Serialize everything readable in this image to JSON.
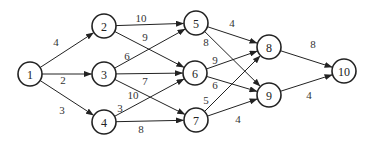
{
  "diagram": {
    "type": "directed-weighted-network",
    "nodes": [
      {
        "id": "1",
        "label": "1",
        "x": 30,
        "y": 74
      },
      {
        "id": "2",
        "label": "2",
        "x": 104,
        "y": 26
      },
      {
        "id": "3",
        "label": "3",
        "x": 104,
        "y": 74
      },
      {
        "id": "4",
        "label": "4",
        "x": 104,
        "y": 122
      },
      {
        "id": "5",
        "label": "5",
        "x": 196,
        "y": 23
      },
      {
        "id": "6",
        "label": "6",
        "x": 195,
        "y": 73
      },
      {
        "id": "7",
        "label": "7",
        "x": 196,
        "y": 120
      },
      {
        "id": "8",
        "label": "8",
        "x": 269,
        "y": 47
      },
      {
        "id": "9",
        "label": "9",
        "x": 269,
        "y": 95
      },
      {
        "id": "10",
        "label": "10",
        "x": 344,
        "y": 71
      }
    ],
    "edges": [
      {
        "from": "1",
        "to": "2",
        "weight": "4",
        "lx": 56,
        "ly": 42
      },
      {
        "from": "1",
        "to": "3",
        "weight": "2",
        "lx": 63,
        "ly": 80
      },
      {
        "from": "1",
        "to": "4",
        "weight": "3",
        "lx": 62,
        "ly": 110
      },
      {
        "from": "2",
        "to": "5",
        "weight": "10",
        "lx": 141,
        "ly": 18
      },
      {
        "from": "2",
        "to": "6",
        "weight": "9",
        "lx": 145,
        "ly": 37
      },
      {
        "from": "3",
        "to": "5",
        "weight": "6",
        "lx": 127,
        "ly": 56
      },
      {
        "from": "3",
        "to": "6",
        "weight": "7",
        "lx": 145,
        "ly": 81
      },
      {
        "from": "3",
        "to": "7",
        "weight": "10",
        "lx": 133,
        "ly": 95
      },
      {
        "from": "4",
        "to": "6",
        "weight": "3",
        "lx": 120,
        "ly": 108
      },
      {
        "from": "4",
        "to": "7",
        "weight": "8",
        "lx": 141,
        "ly": 129
      },
      {
        "from": "5",
        "to": "8",
        "weight": "4",
        "lx": 232,
        "ly": 23
      },
      {
        "from": "5",
        "to": "9",
        "weight": "8",
        "lx": 206,
        "ly": 42
      },
      {
        "from": "6",
        "to": "8",
        "weight": "9",
        "lx": 215,
        "ly": 60
      },
      {
        "from": "6",
        "to": "9",
        "weight": "6",
        "lx": 215,
        "ly": 85
      },
      {
        "from": "7",
        "to": "8",
        "weight": "5",
        "lx": 206,
        "ly": 100
      },
      {
        "from": "7",
        "to": "9",
        "weight": "4",
        "lx": 238,
        "ly": 119
      },
      {
        "from": "8",
        "to": "10",
        "weight": "8",
        "lx": 313,
        "ly": 44
      },
      {
        "from": "9",
        "to": "10",
        "weight": "4",
        "lx": 309,
        "ly": 95
      }
    ]
  }
}
